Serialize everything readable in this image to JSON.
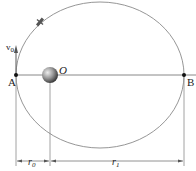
{
  "figure": {
    "type": "orbit-diagram",
    "points": {
      "A": "A",
      "B": "B",
      "O": "O"
    },
    "velocity_label": "v",
    "velocity_sub": "0",
    "dimensions": {
      "r0_main": "r",
      "r0_sub": "0",
      "r1_main": "r",
      "r1_sub": "1"
    },
    "colors": {
      "orbit": "#8a8a8a",
      "line": "#7a7a7a",
      "planet": "#666666"
    }
  }
}
